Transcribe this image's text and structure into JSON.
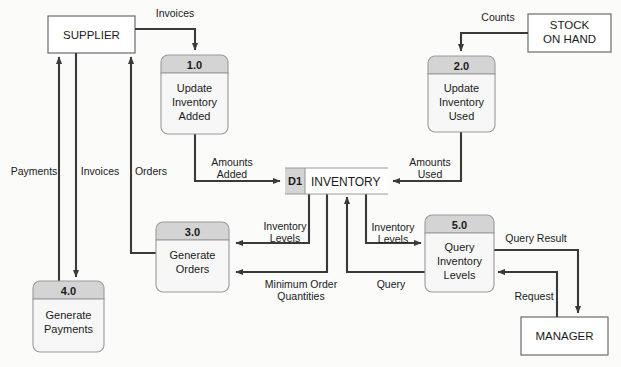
{
  "diagram": {
    "colors": {
      "line": "#3a3a3a",
      "process_header_fill": "#d4d4d4",
      "process_body_fill": "#f7f7f7",
      "process_stroke": "#9a9a9a",
      "entity_fill": "#ffffff",
      "entity_stroke": "#6b6b6b",
      "store_id_fill": "#d4d4d4",
      "store_body_fill": "#ffffff",
      "store_stroke": "#9a9a9a",
      "text": "#1a1a1a",
      "background": "#fbfbfa"
    },
    "external_entities": [
      {
        "id": "supplier",
        "label": "SUPPLIER",
        "lines": [
          "SUPPLIER"
        ]
      },
      {
        "id": "stock-on-hand",
        "label": "STOCK ON HAND",
        "lines": [
          "STOCK",
          "ON HAND"
        ]
      },
      {
        "id": "manager",
        "label": "MANAGER",
        "lines": [
          "MANAGER"
        ]
      }
    ],
    "processes": [
      {
        "id": "process-1",
        "number": "1.0",
        "name": "Update Inventory Added",
        "lines": [
          "Update",
          "Inventory",
          "Added"
        ]
      },
      {
        "id": "process-2",
        "number": "2.0",
        "name": "Update Inventory Used",
        "lines": [
          "Update",
          "Inventory",
          "Used"
        ]
      },
      {
        "id": "process-3",
        "number": "3.0",
        "name": "Generate Orders",
        "lines": [
          "Generate",
          "Orders"
        ]
      },
      {
        "id": "process-4",
        "number": "4.0",
        "name": "Generate Payments",
        "lines": [
          "Generate",
          "Payments"
        ]
      },
      {
        "id": "process-5",
        "number": "5.0",
        "name": "Query Inventory Levels",
        "lines": [
          "Query",
          "Inventory",
          "Levels"
        ]
      }
    ],
    "data_stores": [
      {
        "id": "store-d1",
        "identifier": "D1",
        "name": "INVENTORY"
      }
    ],
    "data_flows": [
      {
        "id": "flow-invoices-supplier-to-1",
        "label": "Invoices",
        "from": "supplier",
        "to": "process-1"
      },
      {
        "id": "flow-counts",
        "label": "Counts",
        "from": "stock-on-hand",
        "to": "process-2"
      },
      {
        "id": "flow-amounts-added",
        "label": "Amounts Added",
        "lines": [
          "Amounts",
          "Added"
        ],
        "from": "process-1",
        "to": "store-d1"
      },
      {
        "id": "flow-amounts-used",
        "label": "Amounts Used",
        "lines": [
          "Amounts",
          "Used"
        ],
        "from": "process-2",
        "to": "store-d1"
      },
      {
        "id": "flow-payments",
        "label": "Payments",
        "from": "process-4",
        "to": "supplier"
      },
      {
        "id": "flow-invoices-supplier-to-4",
        "label": "Invoices",
        "from": "supplier",
        "to": "process-4"
      },
      {
        "id": "flow-orders",
        "label": "Orders",
        "from": "process-3",
        "to": "supplier"
      },
      {
        "id": "flow-inventory-levels-to-3",
        "label": "Inventory Levels",
        "lines": [
          "Inventory",
          "Levels"
        ],
        "from": "store-d1",
        "to": "process-3"
      },
      {
        "id": "flow-minimum-order-quantities",
        "label": "Minimum Order Quantities",
        "lines": [
          "Minimum Order",
          "Quantities"
        ],
        "from": "store-d1",
        "to": "process-3"
      },
      {
        "id": "flow-query",
        "label": "Query",
        "from": "process-5",
        "to": "store-d1"
      },
      {
        "id": "flow-inventory-levels-to-5",
        "label": "Inventory Levels",
        "lines": [
          "Inventory",
          "Levels"
        ],
        "from": "store-d1",
        "to": "process-5"
      },
      {
        "id": "flow-query-result",
        "label": "Query Result",
        "from": "process-5",
        "to": "manager"
      },
      {
        "id": "flow-request",
        "label": "Request",
        "from": "manager",
        "to": "process-5"
      }
    ]
  }
}
